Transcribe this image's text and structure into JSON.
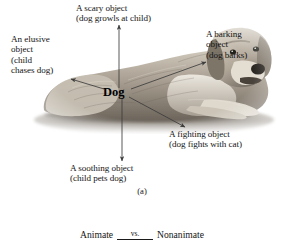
{
  "figure": {
    "panel_a": {
      "caption": "(a)",
      "center_label": "Dog",
      "annotations": [
        {
          "id": "scary",
          "line1": "A scary object",
          "line2": "(dog growls at child)",
          "direction": "up"
        },
        {
          "id": "barking",
          "line1": "A barking",
          "line2": "object",
          "line3": "(dog barks)",
          "direction": "upper-right"
        },
        {
          "id": "fighting",
          "line1": "A fighting object",
          "line2": "(dog fights with cat)",
          "direction": "lower-right"
        },
        {
          "id": "soothing",
          "line1": "A soothing object",
          "line2": "(child pets dog)",
          "direction": "down"
        },
        {
          "id": "elusive",
          "line1": "An elusive",
          "line2": "object",
          "line3": "(child",
          "line4": "chases dog)",
          "direction": "left"
        }
      ],
      "image_alt": "Photograph of a golden retriever lying down"
    },
    "panel_b": {
      "left_term": "Animate",
      "relation": "vs.",
      "right_term": "Nonanimate"
    }
  },
  "colors": {
    "background": "#ffffff",
    "text": "#141414",
    "arrow": "#3c3c3c",
    "fur_light": "#d8d2c6",
    "fur_mid": "#9b9186",
    "fur_dark": "#5d564e"
  }
}
